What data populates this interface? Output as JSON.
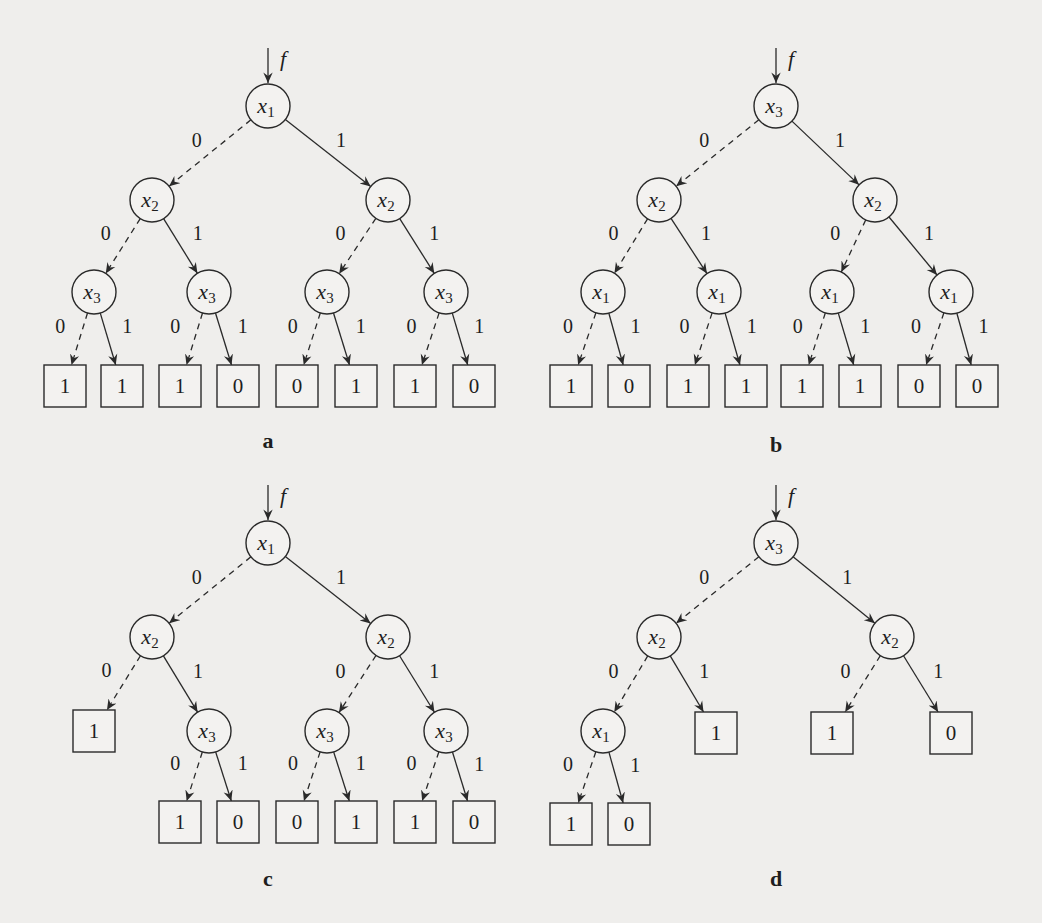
{
  "figure": {
    "panels": [
      {
        "caption": "a",
        "input_label": "f",
        "root": {
          "id": "a_r",
          "var": "x",
          "sub": "1",
          "x": 268,
          "y": 106
        },
        "inputs": {
          "x": 268,
          "y1": 48,
          "y2": 83
        },
        "nodes": [
          {
            "id": "a_r",
            "var": "x",
            "sub": "1",
            "x": 268,
            "y": 106
          },
          {
            "id": "a_l",
            "var": "x",
            "sub": "2",
            "x": 152,
            "y": 200
          },
          {
            "id": "a_rr",
            "var": "x",
            "sub": "2",
            "x": 388,
            "y": 200
          },
          {
            "id": "a_ll",
            "var": "x",
            "sub": "3",
            "x": 94,
            "y": 292
          },
          {
            "id": "a_lr",
            "var": "x",
            "sub": "3",
            "x": 209,
            "y": 292
          },
          {
            "id": "a_rl",
            "var": "x",
            "sub": "3",
            "x": 327,
            "y": 292
          },
          {
            "id": "a_r2",
            "var": "x",
            "sub": "3",
            "x": 446,
            "y": 292
          }
        ],
        "leaves": [
          {
            "id": "a_t1",
            "value": "1",
            "x": 65,
            "y": 386
          },
          {
            "id": "a_t2",
            "value": "1",
            "x": 122,
            "y": 386
          },
          {
            "id": "a_t3",
            "value": "1",
            "x": 180,
            "y": 386
          },
          {
            "id": "a_t4",
            "value": "0",
            "x": 238,
            "y": 386
          },
          {
            "id": "a_t5",
            "value": "0",
            "x": 297,
            "y": 386
          },
          {
            "id": "a_t6",
            "value": "1",
            "x": 356,
            "y": 386
          },
          {
            "id": "a_t7",
            "value": "1",
            "x": 415,
            "y": 386
          },
          {
            "id": "a_t8",
            "value": "0",
            "x": 474,
            "y": 386
          }
        ],
        "edges": [
          {
            "from": "a_r",
            "to": "a_l",
            "label": "0"
          },
          {
            "from": "a_r",
            "to": "a_rr",
            "label": "1"
          },
          {
            "from": "a_l",
            "to": "a_ll",
            "label": "0"
          },
          {
            "from": "a_l",
            "to": "a_lr",
            "label": "1"
          },
          {
            "from": "a_rr",
            "to": "a_rl",
            "label": "0"
          },
          {
            "from": "a_rr",
            "to": "a_r2",
            "label": "1"
          },
          {
            "from": "a_ll",
            "to": "a_t1",
            "label": "0"
          },
          {
            "from": "a_ll",
            "to": "a_t2",
            "label": "1"
          },
          {
            "from": "a_lr",
            "to": "a_t3",
            "label": "0"
          },
          {
            "from": "a_lr",
            "to": "a_t4",
            "label": "1"
          },
          {
            "from": "a_rl",
            "to": "a_t5",
            "label": "0"
          },
          {
            "from": "a_rl",
            "to": "a_t6",
            "label": "1"
          },
          {
            "from": "a_r2",
            "to": "a_t7",
            "label": "0"
          },
          {
            "from": "a_r2",
            "to": "a_t8",
            "label": "1"
          }
        ],
        "caption_pos": {
          "x": 268,
          "y": 448
        }
      },
      {
        "caption": "b",
        "input_label": "f",
        "inputs": {
          "x": 776,
          "y1": 48,
          "y2": 83
        },
        "nodes": [
          {
            "id": "b_r",
            "var": "x",
            "sub": "3",
            "x": 776,
            "y": 106
          },
          {
            "id": "b_l",
            "var": "x",
            "sub": "2",
            "x": 659,
            "y": 200
          },
          {
            "id": "b_rr",
            "var": "x",
            "sub": "2",
            "x": 875,
            "y": 200
          },
          {
            "id": "b_ll",
            "var": "x",
            "sub": "1",
            "x": 603,
            "y": 292
          },
          {
            "id": "b_lr",
            "var": "x",
            "sub": "1",
            "x": 719,
            "y": 292
          },
          {
            "id": "b_rl",
            "var": "x",
            "sub": "1",
            "x": 832,
            "y": 292
          },
          {
            "id": "b_r2",
            "var": "x",
            "sub": "1",
            "x": 951,
            "y": 292
          }
        ],
        "leaves": [
          {
            "id": "b_t1",
            "value": "1",
            "x": 571,
            "y": 386
          },
          {
            "id": "b_t2",
            "value": "0",
            "x": 629,
            "y": 386
          },
          {
            "id": "b_t3",
            "value": "1",
            "x": 688,
            "y": 386
          },
          {
            "id": "b_t4",
            "value": "1",
            "x": 746,
            "y": 386
          },
          {
            "id": "b_t5",
            "value": "1",
            "x": 802,
            "y": 386
          },
          {
            "id": "b_t6",
            "value": "1",
            "x": 860,
            "y": 386
          },
          {
            "id": "b_t7",
            "value": "0",
            "x": 919,
            "y": 386
          },
          {
            "id": "b_t8",
            "value": "0",
            "x": 977,
            "y": 386
          }
        ],
        "edges": [
          {
            "from": "b_r",
            "to": "b_l",
            "label": "0"
          },
          {
            "from": "b_r",
            "to": "b_rr",
            "label": "1"
          },
          {
            "from": "b_l",
            "to": "b_ll",
            "label": "0"
          },
          {
            "from": "b_l",
            "to": "b_lr",
            "label": "1"
          },
          {
            "from": "b_rr",
            "to": "b_rl",
            "label": "0"
          },
          {
            "from": "b_rr",
            "to": "b_r2",
            "label": "1"
          },
          {
            "from": "b_ll",
            "to": "b_t1",
            "label": "0"
          },
          {
            "from": "b_ll",
            "to": "b_t2",
            "label": "1"
          },
          {
            "from": "b_lr",
            "to": "b_t3",
            "label": "0"
          },
          {
            "from": "b_lr",
            "to": "b_t4",
            "label": "1"
          },
          {
            "from": "b_rl",
            "to": "b_t5",
            "label": "0"
          },
          {
            "from": "b_rl",
            "to": "b_t6",
            "label": "1"
          },
          {
            "from": "b_r2",
            "to": "b_t7",
            "label": "0"
          },
          {
            "from": "b_r2",
            "to": "b_t8",
            "label": "1"
          }
        ],
        "caption_pos": {
          "x": 776,
          "y": 452
        }
      },
      {
        "caption": "c",
        "input_label": "f",
        "inputs": {
          "x": 268,
          "y1": 485,
          "y2": 520
        },
        "nodes": [
          {
            "id": "c_r",
            "var": "x",
            "sub": "1",
            "x": 268,
            "y": 543
          },
          {
            "id": "c_l",
            "var": "x",
            "sub": "2",
            "x": 152,
            "y": 637
          },
          {
            "id": "c_rr",
            "var": "x",
            "sub": "2",
            "x": 388,
            "y": 637
          },
          {
            "id": "c_lr",
            "var": "x",
            "sub": "3",
            "x": 209,
            "y": 731
          },
          {
            "id": "c_rl",
            "var": "x",
            "sub": "3",
            "x": 327,
            "y": 731
          },
          {
            "id": "c_r2",
            "var": "x",
            "sub": "3",
            "x": 446,
            "y": 731
          }
        ],
        "leaves": [
          {
            "id": "c_t0",
            "value": "1",
            "x": 94,
            "y": 731
          },
          {
            "id": "c_t3",
            "value": "1",
            "x": 180,
            "y": 822
          },
          {
            "id": "c_t4",
            "value": "0",
            "x": 238,
            "y": 822
          },
          {
            "id": "c_t5",
            "value": "0",
            "x": 297,
            "y": 822
          },
          {
            "id": "c_t6",
            "value": "1",
            "x": 356,
            "y": 822
          },
          {
            "id": "c_t7",
            "value": "1",
            "x": 415,
            "y": 822
          },
          {
            "id": "c_t8",
            "value": "0",
            "x": 474,
            "y": 822
          }
        ],
        "edges": [
          {
            "from": "c_r",
            "to": "c_l",
            "label": "0"
          },
          {
            "from": "c_r",
            "to": "c_rr",
            "label": "1"
          },
          {
            "from": "c_l",
            "to": "c_t0",
            "label": "0"
          },
          {
            "from": "c_l",
            "to": "c_lr",
            "label": "1"
          },
          {
            "from": "c_rr",
            "to": "c_rl",
            "label": "0"
          },
          {
            "from": "c_rr",
            "to": "c_r2",
            "label": "1"
          },
          {
            "from": "c_lr",
            "to": "c_t3",
            "label": "0"
          },
          {
            "from": "c_lr",
            "to": "c_t4",
            "label": "1"
          },
          {
            "from": "c_rl",
            "to": "c_t5",
            "label": "0"
          },
          {
            "from": "c_rl",
            "to": "c_t6",
            "label": "1"
          },
          {
            "from": "c_r2",
            "to": "c_t7",
            "label": "0"
          },
          {
            "from": "c_r2",
            "to": "c_t8",
            "label": "1"
          }
        ],
        "caption_pos": {
          "x": 268,
          "y": 886
        }
      },
      {
        "caption": "d",
        "input_label": "f",
        "inputs": {
          "x": 776,
          "y1": 485,
          "y2": 520
        },
        "nodes": [
          {
            "id": "d_r",
            "var": "x",
            "sub": "3",
            "x": 776,
            "y": 543
          },
          {
            "id": "d_l",
            "var": "x",
            "sub": "2",
            "x": 659,
            "y": 637
          },
          {
            "id": "d_rr",
            "var": "x",
            "sub": "2",
            "x": 892,
            "y": 637
          },
          {
            "id": "d_ll",
            "var": "x",
            "sub": "1",
            "x": 603,
            "y": 731
          }
        ],
        "leaves": [
          {
            "id": "d_t1",
            "value": "1",
            "x": 716,
            "y": 733
          },
          {
            "id": "d_t2",
            "value": "1",
            "x": 832,
            "y": 733
          },
          {
            "id": "d_t3",
            "value": "0",
            "x": 951,
            "y": 733
          },
          {
            "id": "d_t4",
            "value": "1",
            "x": 571,
            "y": 824
          },
          {
            "id": "d_t5",
            "value": "0",
            "x": 629,
            "y": 824
          }
        ],
        "edges": [
          {
            "from": "d_r",
            "to": "d_l",
            "label": "0"
          },
          {
            "from": "d_r",
            "to": "d_rr",
            "label": "1"
          },
          {
            "from": "d_l",
            "to": "d_ll",
            "label": "0"
          },
          {
            "from": "d_l",
            "to": "d_t1",
            "label": "1"
          },
          {
            "from": "d_rr",
            "to": "d_t2",
            "label": "0"
          },
          {
            "from": "d_rr",
            "to": "d_t3",
            "label": "1"
          },
          {
            "from": "d_ll",
            "to": "d_t4",
            "label": "0"
          },
          {
            "from": "d_ll",
            "to": "d_t5",
            "label": "1"
          }
        ],
        "caption_pos": {
          "x": 776,
          "y": 886
        }
      }
    ],
    "style": {
      "node_radius": 22,
      "leaf_size": 42,
      "stroke_color": "#2a2a2a",
      "background": "#efeeec",
      "zero_edge": "dashed",
      "one_edge": "solid"
    }
  }
}
